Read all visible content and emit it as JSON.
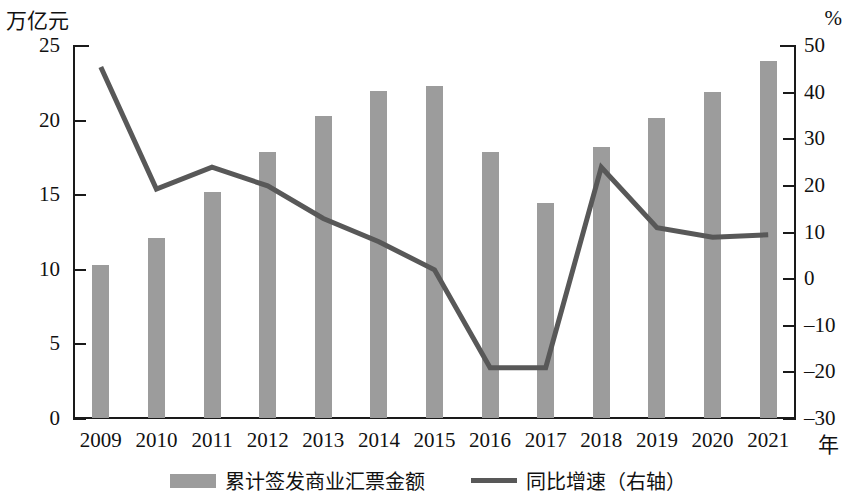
{
  "chart_data": {
    "type": "bar",
    "title": "",
    "xlabel": "年",
    "ylabel_left": "万亿元",
    "ylabel_right": "%",
    "grid": false,
    "legend_position": "bottom",
    "categories": [
      "2009",
      "2010",
      "2011",
      "2012",
      "2013",
      "2014",
      "2015",
      "2016",
      "2017",
      "2018",
      "2019",
      "2020",
      "2021"
    ],
    "left_axis": {
      "unit": "万亿元",
      "min": 0,
      "max": 25,
      "step": 5,
      "ticks": [
        "0",
        "5",
        "10",
        "15",
        "20",
        "25"
      ]
    },
    "right_axis": {
      "unit": "%",
      "min": -30,
      "max": 50,
      "step": 10,
      "ticks": [
        "-30",
        "-20",
        "-10",
        "0",
        "10",
        "20",
        "30",
        "40",
        "50"
      ]
    },
    "series": [
      {
        "name": "累计签发商业汇票金额",
        "type": "bar",
        "axis": "left",
        "color": "#9c9c9c",
        "values": [
          10.3,
          12.1,
          15.2,
          17.9,
          20.3,
          22.0,
          22.3,
          17.9,
          14.5,
          18.2,
          20.2,
          21.9,
          24.0
        ]
      },
      {
        "name": "同比增速（右轴）",
        "type": "line",
        "axis": "right",
        "color": "#585858",
        "values": [
          45.5,
          19.3,
          24.0,
          20.0,
          13.0,
          8.0,
          2.0,
          -19.0,
          -19.0,
          24.0,
          11.0,
          9.0,
          9.5
        ]
      }
    ]
  },
  "legend": {
    "items": [
      {
        "label": "累计签发商业汇票金额",
        "marker": "bar-swatch"
      },
      {
        "label": "同比增速（右轴）",
        "marker": "line-swatch"
      }
    ]
  },
  "axis_captions": {
    "left_unit": "万亿元",
    "right_unit": "%",
    "x_unit": "年"
  }
}
